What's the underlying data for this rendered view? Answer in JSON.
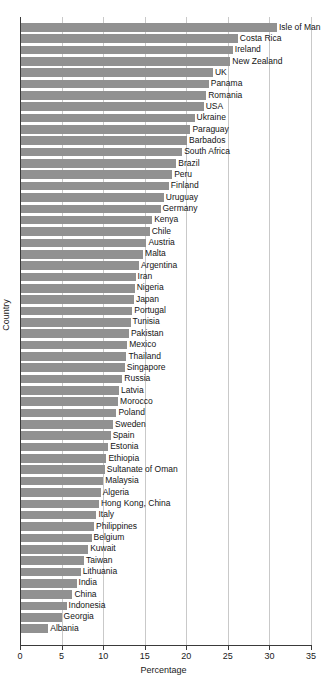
{
  "chart_data": {
    "type": "bar",
    "orientation": "horizontal",
    "title": "",
    "xlabel": "Percentage",
    "ylabel": "Country",
    "xlim": [
      0,
      35
    ],
    "xticks": [
      0,
      5,
      10,
      15,
      20,
      25,
      30,
      35
    ],
    "grid": true,
    "legend": false,
    "bar_color": "#919191",
    "categories": [
      "Isle of Man",
      "Costa Rica",
      "Ireland",
      "New Zealand",
      "UK",
      "Panama",
      "Romania",
      "USA",
      "Ukraine",
      "Paraguay",
      "Barbados",
      "South Africa",
      "Brazil",
      "Peru",
      "Finland",
      "Uruguay",
      "Germany",
      "Kenya",
      "Chile",
      "Austria",
      "Malta",
      "Argentina",
      "Iran",
      "Nigeria",
      "Japan",
      "Portugal",
      "Tunisia",
      "Pakistan",
      "Mexico",
      "Thailand",
      "Singapore",
      "Russia",
      "Latvia",
      "Morocco",
      "Poland",
      "Sweden",
      "Spain",
      "Estonia",
      "Ethiopia",
      "Sultanate of Oman",
      "Malaysia",
      "Algeria",
      "Hong Kong, China",
      "Italy",
      "Philippines",
      "Belgium",
      "Kuwait",
      "Taiwan",
      "Lithuania",
      "India",
      "China",
      "Indonesia",
      "Georgia",
      "Albania"
    ],
    "values": [
      30.9,
      26.2,
      25.6,
      25.3,
      23.2,
      22.7,
      22.4,
      22.1,
      21.0,
      20.5,
      20.1,
      19.5,
      18.8,
      18.3,
      17.9,
      17.3,
      16.9,
      15.9,
      15.6,
      15.2,
      14.8,
      14.3,
      13.9,
      13.8,
      13.7,
      13.5,
      13.3,
      13.1,
      12.9,
      12.8,
      12.6,
      12.3,
      11.9,
      11.8,
      11.6,
      11.2,
      10.9,
      10.6,
      10.4,
      10.2,
      10.0,
      9.7,
      9.5,
      9.2,
      8.9,
      8.6,
      8.2,
      7.7,
      7.3,
      6.8,
      6.3,
      5.6,
      5.0,
      3.4
    ]
  }
}
